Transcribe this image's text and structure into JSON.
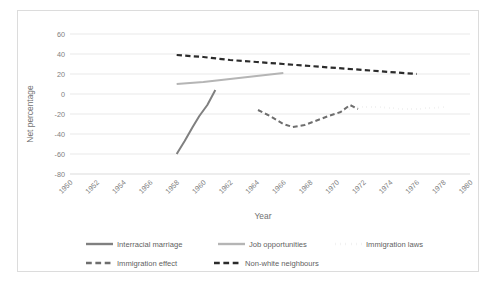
{
  "chart_data": {
    "type": "line",
    "title": "",
    "subtitle": "",
    "xlabel": "Year",
    "ylabel": "Net percentage",
    "xlim": [
      1950,
      1980
    ],
    "ylim": [
      -80,
      60
    ],
    "xticks": [
      "1950",
      "1952",
      "1954",
      "1956",
      "1958",
      "1960",
      "1962",
      "1964",
      "1966",
      "1968",
      "1970",
      "1972",
      "1974",
      "1976",
      "1978",
      "1980"
    ],
    "yticks": [
      "60",
      "40",
      "20",
      "0",
      "-20",
      "-40",
      "-60",
      "-80"
    ],
    "grid": "horizontal",
    "legend_position": "bottom",
    "series": [
      {
        "name": "Interracial marriage",
        "color": "#808080",
        "style": "solid",
        "width": 2.0,
        "points": [
          {
            "x": 1958.0,
            "y": -60
          },
          {
            "x": 1958.6,
            "y": -47
          },
          {
            "x": 1959.2,
            "y": -33
          },
          {
            "x": 1959.7,
            "y": -22
          },
          {
            "x": 1960.3,
            "y": -11
          },
          {
            "x": 1960.9,
            "y": 4
          }
        ]
      },
      {
        "name": "Job opportunities",
        "color": "#b5b5b5",
        "style": "solid",
        "width": 2.2,
        "points": [
          {
            "x": 1958.0,
            "y": 10
          },
          {
            "x": 1960.0,
            "y": 12
          },
          {
            "x": 1962.0,
            "y": 15
          },
          {
            "x": 1964.0,
            "y": 18
          },
          {
            "x": 1966.0,
            "y": 21
          }
        ]
      },
      {
        "name": "Immigration laws",
        "color": "#777777",
        "style": "dotted",
        "width": 2.0,
        "points": [
          {
            "x": 1970.6,
            "y": -16
          },
          {
            "x": 1971.2,
            "y": -14
          },
          {
            "x": 1972.0,
            "y": -13
          },
          {
            "x": 1973.0,
            "y": -13
          },
          {
            "x": 1974.0,
            "y": -14
          },
          {
            "x": 1975.0,
            "y": -15
          },
          {
            "x": 1976.0,
            "y": -15
          },
          {
            "x": 1977.0,
            "y": -14
          },
          {
            "x": 1978.2,
            "y": -13
          }
        ]
      },
      {
        "name": "Immigration effect",
        "color": "#6e6e6e",
        "style": "dashed",
        "width": 2.0,
        "points": [
          {
            "x": 1964.1,
            "y": -16
          },
          {
            "x": 1965.0,
            "y": -22
          },
          {
            "x": 1966.0,
            "y": -30
          },
          {
            "x": 1966.7,
            "y": -33
          },
          {
            "x": 1967.6,
            "y": -31
          },
          {
            "x": 1968.4,
            "y": -27
          },
          {
            "x": 1969.4,
            "y": -22
          },
          {
            "x": 1970.3,
            "y": -18
          },
          {
            "x": 1971.0,
            "y": -11
          },
          {
            "x": 1971.6,
            "y": -15
          }
        ]
      },
      {
        "name": "Non-white neighbours",
        "color": "#2b2b2b",
        "style": "dashed",
        "width": 2.2,
        "points": [
          {
            "x": 1958.0,
            "y": 39
          },
          {
            "x": 1960.0,
            "y": 37
          },
          {
            "x": 1962.0,
            "y": 34
          },
          {
            "x": 1964.0,
            "y": 32
          },
          {
            "x": 1966.0,
            "y": 30
          },
          {
            "x": 1968.0,
            "y": 28
          },
          {
            "x": 1970.0,
            "y": 26
          },
          {
            "x": 1972.0,
            "y": 24
          },
          {
            "x": 1974.0,
            "y": 22
          },
          {
            "x": 1976.0,
            "y": 20
          }
        ]
      }
    ]
  },
  "legend": {
    "entries": [
      {
        "label": "Interracial marriage",
        "style": "solid",
        "color": "#808080"
      },
      {
        "label": "Job opportunities",
        "style": "solid",
        "color": "#b5b5b5"
      },
      {
        "label": "Immigration laws",
        "style": "dotted",
        "color": "#777777"
      },
      {
        "label": "Immigration effect",
        "style": "dashed",
        "color": "#6e6e6e"
      },
      {
        "label": "Non-white neighbours",
        "style": "dashed",
        "color": "#2b2b2b"
      }
    ]
  },
  "axes": {
    "x_title": "Year",
    "y_title": "Net percentage"
  }
}
